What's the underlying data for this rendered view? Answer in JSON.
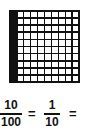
{
  "grid": {
    "rows": 10,
    "cols": 10,
    "filled_columns": [
      0
    ],
    "fill_color": "#111111"
  },
  "equation": {
    "fraction1": {
      "numerator": "10",
      "denominator": "100"
    },
    "equals1": "=",
    "fraction2": {
      "numerator": "1",
      "denominator": "10"
    },
    "equals2": "="
  }
}
